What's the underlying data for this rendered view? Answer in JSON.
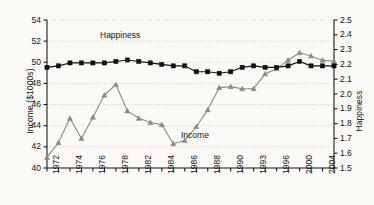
{
  "chart_data": {
    "type": "line",
    "title": "",
    "subtitle": "",
    "xlabel": "",
    "ylabel": "Income ($1000s)",
    "y2label": "Happiness",
    "grid": true,
    "legend_position": "inline-annotations",
    "x": [
      "1972",
      "1973",
      "1974",
      "1975",
      "1976",
      "1977",
      "1978",
      "1979",
      "1982",
      "1983",
      "1984",
      "1985",
      "1986",
      "1987",
      "1988",
      "1989",
      "1990",
      "1991",
      "1993",
      "1994",
      "1996",
      "1998",
      "2000",
      "2002",
      "2004",
      "2006"
    ],
    "xtick_labels": [
      "1972",
      "1974",
      "1976",
      "1978",
      "1982",
      "1984",
      "1986",
      "1988",
      "1990",
      "1993",
      "1996",
      "2000",
      "2004"
    ],
    "xlim": [
      "1972",
      "2006"
    ],
    "ylim": [
      40,
      54
    ],
    "ytick_labels": [
      "40",
      "42",
      "44",
      "46",
      "48",
      "50",
      "52",
      "54"
    ],
    "y2lim": [
      1.5,
      2.5
    ],
    "y2tick_labels": [
      "1.5",
      "1.6",
      "1.7",
      "1.8",
      "1.9",
      "2.0",
      "2.1",
      "2.2",
      "2.3",
      "2.4",
      "2.5"
    ],
    "series": [
      {
        "name": "Happiness",
        "axis": "right",
        "marker": "square",
        "color": "#111111",
        "label_text": "Happiness",
        "values": [
          2.18,
          2.19,
          2.21,
          2.21,
          2.21,
          2.21,
          2.22,
          2.23,
          2.22,
          2.21,
          2.2,
          2.19,
          2.19,
          2.15,
          2.15,
          2.14,
          2.15,
          2.18,
          2.19,
          2.18,
          2.18,
          2.19,
          2.22,
          2.19,
          2.19,
          2.19
        ]
      },
      {
        "name": "Income",
        "axis": "left",
        "marker": "triangle",
        "color": "#8a8a82",
        "label_text": "Income",
        "values": [
          41.0,
          42.4,
          44.7,
          42.8,
          44.8,
          46.9,
          47.9,
          45.4,
          44.7,
          44.3,
          44.1,
          42.3,
          42.6,
          43.9,
          45.5,
          47.6,
          47.7,
          47.5,
          47.5,
          48.9,
          49.4,
          50.2,
          50.9,
          50.6,
          50.2,
          50.1
        ]
      }
    ],
    "annotations": [
      {
        "text": "Happiness",
        "x_pixel": 100,
        "y_pixel": 30
      },
      {
        "text": "Income",
        "x_pixel": 181,
        "y_pixel": 130
      }
    ]
  },
  "colors": {
    "background": "#fbfaf7",
    "plot_background": "#fdfcf9",
    "axis": "#1a1a1a",
    "grid": "#c9c6bd",
    "happiness": "#111111",
    "income": "#8a8a82"
  }
}
